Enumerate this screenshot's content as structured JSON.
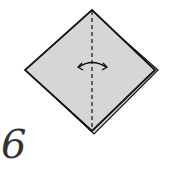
{
  "diagram": {
    "step_number": "6",
    "paper_color": "#d6d6d6",
    "line_color": "#111111",
    "fold_line": "valley-fold-dashed-vertical",
    "arrow": "fold-and-unfold-arrow"
  }
}
